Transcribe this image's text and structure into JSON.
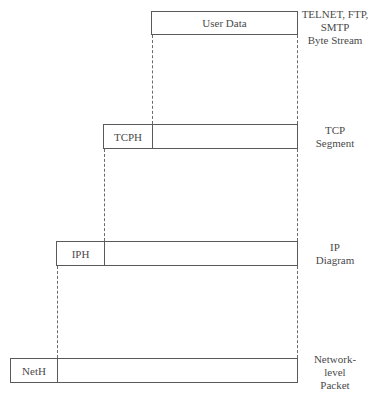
{
  "layers": [
    {
      "id": "application",
      "header": "",
      "payload": "User Data",
      "label": [
        "TELNET, FTP,",
        "SMTP",
        "Byte Stream"
      ]
    },
    {
      "id": "tcp",
      "header": "TCPH",
      "payload": "",
      "label": [
        "TCP",
        "Segment"
      ]
    },
    {
      "id": "ip",
      "header": "IPH",
      "payload": "",
      "label": [
        "IP",
        "Diagram"
      ]
    },
    {
      "id": "network",
      "header": "NetH",
      "payload": "",
      "label": [
        "Network-",
        "level",
        "Packet"
      ]
    }
  ],
  "colors": {
    "line": "#5a5a5a",
    "text": "#4a4a4a",
    "background": "#ffffff"
  }
}
